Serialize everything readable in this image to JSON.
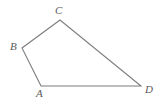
{
  "figure": {
    "kind": "quadrilateral",
    "name": "Quadrilateral ABCD",
    "stroke_color": "#7d7d7d",
    "label_color": "#5a5a5a",
    "background_color": "#ffffff",
    "fill": "none",
    "stroke_width": 1.1,
    "vertices": [
      {
        "label": "A",
        "x": 41,
        "y": 86
      },
      {
        "label": "B",
        "x": 22,
        "y": 48
      },
      {
        "label": "C",
        "x": 60,
        "y": 20
      },
      {
        "label": "D",
        "x": 141,
        "y": 86
      }
    ],
    "edges": [
      {
        "name": "A-B",
        "from": "A",
        "to": "B"
      },
      {
        "name": "B-C",
        "from": "B",
        "to": "C"
      },
      {
        "name": "C-D",
        "from": "C",
        "to": "D"
      },
      {
        "name": "D-A",
        "from": "D",
        "to": "A"
      }
    ],
    "path": "M 41 86 L 22 48 L 60 20 L 141 86 Z",
    "labels": {
      "A": "A",
      "B": "B",
      "C": "C",
      "D": "D"
    }
  }
}
